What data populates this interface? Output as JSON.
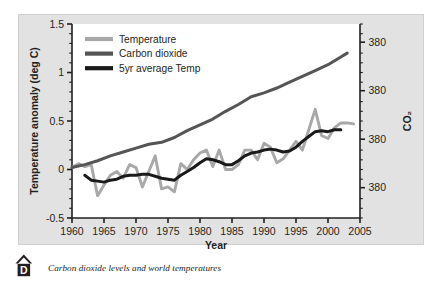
{
  "caption": {
    "badge_letter": "D",
    "text": "Carbon dioxide levels and world temperatures"
  },
  "colors": {
    "temperature": "#a8a8a8",
    "carbon_dioxide": "#555555",
    "five_year_avg": "#1a1a1a",
    "panel_background": "#e2e2e2",
    "plot_background": "#ffffff",
    "axis": "#231f20"
  },
  "chart_data": {
    "type": "line",
    "title": "",
    "xlabel": "Year",
    "ylabel": "Temperature anomaly (deg C)",
    "y2label": "CO₂",
    "xlim": [
      1960,
      2005
    ],
    "ylim": [
      -0.5,
      1.5
    ],
    "grid": false,
    "legend_position": "top-left",
    "xticks": [
      1960,
      1965,
      1970,
      1975,
      1980,
      1985,
      1990,
      1995,
      2000,
      2005
    ],
    "xtick_labels": [
      "1960",
      "1965",
      "1970",
      "1975",
      "1980",
      "1985",
      "1990",
      "1995",
      "2000",
      "2005"
    ],
    "yticks": [
      -0.5,
      0,
      0.5,
      1,
      1.5
    ],
    "ytick_labels": [
      "-0.5",
      "0",
      "0.5",
      "1",
      "1.5"
    ],
    "y2tick_labels": [
      "380",
      "380",
      "380",
      "380"
    ],
    "y2tick_values": [
      1.3125,
      0.8125,
      0.3125,
      -0.1875
    ],
    "y2_minor_tick_count": 20,
    "series": [
      {
        "name": "Temperature",
        "color": "#a8a8a8",
        "x": [
          1960,
          1961,
          1962,
          1963,
          1964,
          1965,
          1966,
          1967,
          1968,
          1969,
          1970,
          1971,
          1972,
          1973,
          1974,
          1975,
          1976,
          1977,
          1978,
          1979,
          1980,
          1981,
          1982,
          1983,
          1984,
          1985,
          1986,
          1987,
          1988,
          1989,
          1990,
          1991,
          1992,
          1993,
          1994,
          1995,
          1996,
          1997,
          1998,
          1999,
          2000,
          2001,
          2002,
          2003,
          2004
        ],
        "values": [
          0.02,
          0.06,
          0.03,
          0.05,
          -0.27,
          -0.16,
          -0.06,
          -0.02,
          -0.09,
          0.05,
          0.02,
          -0.18,
          -0.02,
          0.14,
          -0.2,
          -0.18,
          -0.23,
          0.06,
          0.0,
          0.1,
          0.17,
          0.2,
          0.03,
          0.2,
          0.0,
          0.0,
          0.05,
          0.2,
          0.2,
          0.1,
          0.27,
          0.23,
          0.07,
          0.11,
          0.2,
          0.29,
          0.2,
          0.41,
          0.62,
          0.35,
          0.32,
          0.43,
          0.48,
          0.48,
          0.47
        ]
      },
      {
        "name": "Carbon dioxide",
        "color": "#555555",
        "x": [
          1960,
          1962,
          1964,
          1966,
          1968,
          1970,
          1972,
          1974,
          1976,
          1978,
          1980,
          1982,
          1984,
          1986,
          1988,
          1990,
          1992,
          1994,
          1996,
          1998,
          2000,
          2002,
          2003
        ],
        "values": [
          0.02,
          0.05,
          0.09,
          0.14,
          0.18,
          0.22,
          0.26,
          0.28,
          0.33,
          0.4,
          0.46,
          0.52,
          0.6,
          0.67,
          0.75,
          0.79,
          0.84,
          0.9,
          0.96,
          1.02,
          1.08,
          1.16,
          1.2
        ]
      },
      {
        "name": "5yr average Temp",
        "color": "#1a1a1a",
        "x": [
          1962,
          1963,
          1964,
          1965,
          1966,
          1967,
          1968,
          1969,
          1970,
          1971,
          1972,
          1973,
          1974,
          1975,
          1976,
          1977,
          1978,
          1979,
          1980,
          1981,
          1982,
          1983,
          1984,
          1985,
          1986,
          1987,
          1988,
          1989,
          1990,
          1991,
          1992,
          1993,
          1994,
          1995,
          1996,
          1997,
          1998,
          1999,
          2000,
          2001,
          2002
        ],
        "values": [
          -0.06,
          -0.11,
          -0.12,
          -0.13,
          -0.11,
          -0.1,
          -0.07,
          -0.06,
          -0.06,
          -0.05,
          -0.05,
          -0.07,
          -0.09,
          -0.1,
          -0.11,
          -0.06,
          -0.02,
          0.02,
          0.07,
          0.11,
          0.1,
          0.08,
          0.05,
          0.05,
          0.09,
          0.14,
          0.17,
          0.18,
          0.2,
          0.21,
          0.2,
          0.18,
          0.19,
          0.23,
          0.29,
          0.34,
          0.39,
          0.4,
          0.39,
          0.41,
          0.41
        ]
      }
    ]
  },
  "legend": {
    "items": [
      {
        "label": "Temperature",
        "color": "#a8a8a8"
      },
      {
        "label": "Carbon dioxide",
        "color": "#555555"
      },
      {
        "label": "5yr average Temp",
        "color": "#1a1a1a"
      }
    ]
  }
}
